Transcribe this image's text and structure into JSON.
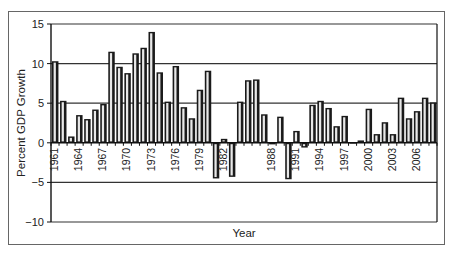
{
  "chart_data": {
    "type": "bar",
    "title": "",
    "xlabel": "Year",
    "ylabel": "Percent GDP Growth",
    "ylim": [
      -10,
      15
    ],
    "yticks": [
      15,
      10,
      5,
      0,
      -5,
      -10
    ],
    "ytick_labels": [
      "15",
      "10",
      "5",
      "0",
      "−5",
      "−10"
    ],
    "grid": true,
    "legend": null,
    "x_tick_labels": [
      "1961",
      "1964",
      "1967",
      "1970",
      "1973",
      "1976",
      "1979",
      "1982",
      "1988",
      "1991",
      "1994",
      "1997",
      "2000",
      "2003",
      "2006"
    ],
    "categories": [
      "1961",
      "1962",
      "1963",
      "1964",
      "1965",
      "1966",
      "1967",
      "1968",
      "1969",
      "1970",
      "1971",
      "1972",
      "1973",
      "1974",
      "1975",
      "1976",
      "1977",
      "1978",
      "1979",
      "1980",
      "1981",
      "1982",
      "1983",
      "1984",
      "1985",
      "1986",
      "1987",
      "1988",
      "1989",
      "1990",
      "1991",
      "1992",
      "1993",
      "1994",
      "1995",
      "1996",
      "1997",
      "1998",
      "1999",
      "2000",
      "2001",
      "2002",
      "2003",
      "2004",
      "2005",
      "2006",
      "2007",
      "2008"
    ],
    "values": [
      10.3,
      5.3,
      0.8,
      3.5,
      3.0,
      4.2,
      4.9,
      11.5,
      9.6,
      8.8,
      11.3,
      12.0,
      14.0,
      8.9,
      5.2,
      9.7,
      4.5,
      3.1,
      6.7,
      9.1,
      -4.5,
      0.5,
      -4.3,
      5.2,
      7.9,
      8.0,
      3.6,
      -0.2,
      3.3,
      -4.6,
      1.5,
      -0.6,
      4.8,
      5.3,
      4.4,
      2.1,
      3.4,
      0.0,
      0.3,
      4.3,
      1.1,
      2.6,
      1.1,
      5.7,
      3.1,
      4.0,
      5.7,
      5.1
    ]
  },
  "colors": {
    "bar_fill": "#1a1a1a",
    "bar_highlight": "#e8e8e8",
    "gridline": "#333333",
    "frame": "#666666"
  }
}
